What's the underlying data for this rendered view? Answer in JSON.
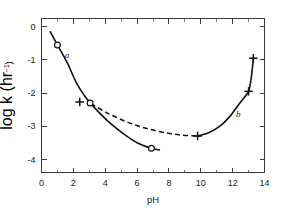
{
  "chart_data": {
    "type": "line",
    "title": "",
    "xlabel": "pH",
    "ylabel_prefix": "log ",
    "ylabel_italic": "k",
    "ylabel_units_open": " (hr",
    "ylabel_units_sup": "−1",
    "ylabel_units_close": ")",
    "xlim": [
      0,
      14
    ],
    "ylim": [
      -4.4,
      0.25
    ],
    "xticks_major": [
      0,
      2,
      4,
      6,
      8,
      10,
      12,
      14
    ],
    "xticks_major_labels": [
      "0",
      "2",
      "4",
      "6",
      "8",
      "10",
      "12",
      "14"
    ],
    "xticks_minor": [
      1,
      3,
      5,
      7,
      9,
      11,
      13
    ],
    "yticks_major": [
      0,
      -1,
      -2,
      -3,
      -4
    ],
    "yticks_major_labels": [
      "0",
      "-1",
      "-2",
      "-3",
      "-4"
    ],
    "grid": false,
    "legend": "none",
    "frame": "box",
    "series": [
      {
        "name": "a",
        "label": "a",
        "label_x": 1.6,
        "label_y": -0.95,
        "style": "solid",
        "points": [
          {
            "x": 0.55,
            "y": -0.15
          },
          {
            "x": 1.0,
            "y": -0.55
          },
          {
            "x": 1.6,
            "y": -1.07
          },
          {
            "x": 2.2,
            "y": -1.7
          },
          {
            "x": 2.7,
            "y": -2.08
          },
          {
            "x": 3.1,
            "y": -2.32
          },
          {
            "x": 3.7,
            "y": -2.63
          },
          {
            "x": 4.4,
            "y": -2.95
          },
          {
            "x": 5.2,
            "y": -3.25
          },
          {
            "x": 6.0,
            "y": -3.5
          },
          {
            "x": 6.9,
            "y": -3.67
          },
          {
            "x": 7.4,
            "y": -3.72
          }
        ]
      },
      {
        "name": "b",
        "label": "b",
        "label_x": 12.35,
        "label_y": -2.72,
        "style": "solid",
        "points": [
          {
            "x": 9.8,
            "y": -3.3
          },
          {
            "x": 10.5,
            "y": -3.2
          },
          {
            "x": 11.2,
            "y": -3.0
          },
          {
            "x": 11.8,
            "y": -2.72
          },
          {
            "x": 12.3,
            "y": -2.4
          },
          {
            "x": 12.7,
            "y": -2.15
          },
          {
            "x": 13.0,
            "y": -1.95
          },
          {
            "x": 13.15,
            "y": -1.6
          },
          {
            "x": 13.25,
            "y": -1.2
          },
          {
            "x": 13.3,
            "y": -0.95
          }
        ]
      },
      {
        "name": "dashed-connector",
        "label": "",
        "style": "dashed",
        "points": [
          {
            "x": 3.1,
            "y": -2.32
          },
          {
            "x": 4.2,
            "y": -2.62
          },
          {
            "x": 5.4,
            "y": -2.88
          },
          {
            "x": 6.6,
            "y": -3.07
          },
          {
            "x": 7.8,
            "y": -3.2
          },
          {
            "x": 8.8,
            "y": -3.27
          },
          {
            "x": 9.8,
            "y": -3.3
          }
        ]
      }
    ],
    "markers_circle": [
      {
        "x": 1.0,
        "y": -0.55
      },
      {
        "x": 3.05,
        "y": -2.3
      },
      {
        "x": 6.9,
        "y": -3.67
      }
    ],
    "markers_plus": [
      {
        "x": 2.4,
        "y": -2.27
      },
      {
        "x": 9.8,
        "y": -3.3
      },
      {
        "x": 13.0,
        "y": -1.95
      },
      {
        "x": 13.3,
        "y": -0.95
      }
    ],
    "colors": {
      "curve": "#111111",
      "axis": "#3a3a3a",
      "background": "#ffffff"
    }
  }
}
